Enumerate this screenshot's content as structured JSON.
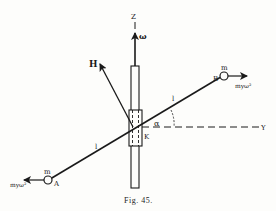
{
  "figure": {
    "caption": "Fig. 45.",
    "labels": {
      "z_axis": "Z",
      "omega": "ω",
      "h_vector": "H",
      "point_a": "A",
      "point_b": "B",
      "mass_a": "m",
      "mass_b": "m",
      "force_a": "myω²",
      "force_b": "myω²",
      "length_upper": "l",
      "length_lower": "l",
      "angle": "α",
      "pivot": "K",
      "y_axis": "Y"
    },
    "colors": {
      "ink": "#1a1a1a",
      "paper": "#fdfdfb"
    }
  }
}
